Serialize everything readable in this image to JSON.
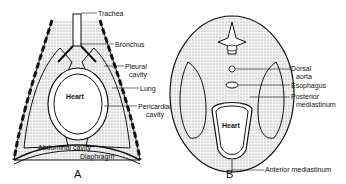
{
  "figure": {
    "panel_a": {
      "caption": "A",
      "labels": {
        "trachea": "Trachea",
        "bronchus": "Bronchus",
        "pleural_cavity_1": "Pleural",
        "pleural_cavity_2": "cavity",
        "lung": "Lung",
        "heart": "Heart",
        "pericardial_cavity_1": "Pericardial",
        "pericardial_cavity_2": "cavity",
        "abdominal_cavity": "Abdominal  cavity",
        "diaphragm": "Diaphragm"
      }
    },
    "panel_b": {
      "caption": "B",
      "labels": {
        "dorsal_aorta_1": "Dorsal",
        "dorsal_aorta_2": "aorta",
        "esophagus": "Esophagus",
        "posterior_mediastinum_1": "Posterior",
        "posterior_mediastinum_2": "mediastinum",
        "heart": "Heart",
        "anterior_mediastinum": "Anterior mediastinum"
      }
    }
  }
}
